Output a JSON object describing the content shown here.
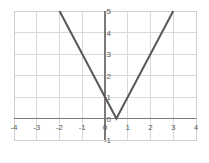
{
  "chart_data": {
    "type": "line",
    "title": "",
    "subtitle": "",
    "xlabel": "",
    "ylabel": "",
    "xlim": [
      -4,
      4
    ],
    "ylim": [
      -1,
      5
    ],
    "grid": true,
    "legend": null,
    "legend_position": "none",
    "x_ticks": [
      "-4",
      "-3",
      "-2",
      "-1",
      "0",
      "1",
      "2",
      "3",
      "4"
    ],
    "x_tick_values": [
      -4,
      -3,
      -2,
      -1,
      0,
      1,
      2,
      3,
      4
    ],
    "y_ticks": [
      "-1",
      "0",
      "1",
      "2",
      "3",
      "4",
      "5"
    ],
    "y_tick_values": [
      -1,
      0,
      1,
      2,
      3,
      4,
      5
    ],
    "series": [
      {
        "name": "y = |2x - 1|",
        "x": [
          -2,
          0.5,
          3
        ],
        "values": [
          5,
          0,
          5
        ],
        "color": "#595959",
        "width": 2
      }
    ],
    "annotations": [
      {
        "label": "vertex",
        "x": 0.5,
        "y": 0
      },
      {
        "label": "y-intercept",
        "x": 0,
        "y": 1
      }
    ],
    "colors": {
      "curve": "#595959",
      "axis": "#7a7a7a",
      "grid": "#d9d9d9",
      "plot_border": "#d0d0d0",
      "background": "#ffffff",
      "tick_text": "#5a5a5a"
    }
  },
  "axes": {
    "x_axis_name": "x-axis",
    "y_axis_name": "y-axis"
  }
}
